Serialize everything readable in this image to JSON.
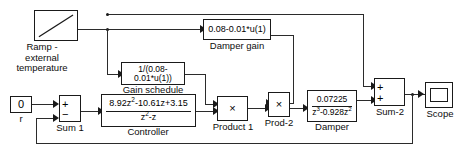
{
  "diagram": {
    "colors": {
      "line": "#2b2b2b",
      "block_border": "#1a1a1a",
      "block_fill": "#ffffff",
      "text": "#0d0d0d",
      "background": "#ffffff"
    }
  },
  "blocks": {
    "ramp": {
      "icon": "ramp-icon",
      "label_line1": "Ramp -",
      "label_line2": "external",
      "label_line3": "temperature"
    },
    "constant": {
      "value": "0",
      "label": "r"
    },
    "sum1": {
      "label": "Sum 1",
      "sign_top": "+",
      "sign_bottom": "−"
    },
    "controller": {
      "numerator": "8.92z",
      "numerator_sup": "2",
      "numerator_rest": "-10.61z+3.15",
      "denominator": "z",
      "denominator_sup": "2",
      "denominator_rest": "-z",
      "label": "Controller"
    },
    "gain_schedule": {
      "expression": "1/(0.08-0.01*u(1))",
      "label": "Gain schedule"
    },
    "damper_gain": {
      "expression": "0.08-0.01*u(1)",
      "label": "Damper gain"
    },
    "product1": {
      "symbol": "×",
      "label": "Product 1"
    },
    "prod2": {
      "symbol": "×",
      "label": "Prod-2"
    },
    "damper": {
      "numerator": "0.07225",
      "denominator": "z",
      "denominator_sup": "3",
      "denominator_mid": "-0.928z",
      "denominator_sup2": "2",
      "label": "Damper"
    },
    "sum2": {
      "label": "Sum-2",
      "sign_top": "+",
      "sign_bottom": "+"
    },
    "scope": {
      "label": "Scope",
      "icon": "scope-icon"
    }
  }
}
